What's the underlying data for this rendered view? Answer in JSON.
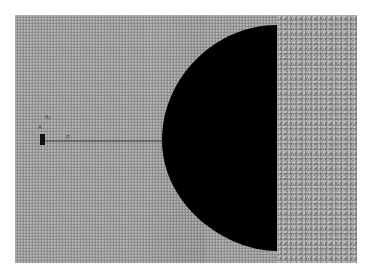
{
  "figure": {
    "background_color": "#ffffff",
    "domain_color": "#9a9a9a",
    "inclusion_color": "#000000",
    "crack_color": "#3a3a3a",
    "labels": {
      "label_a": "θ₀",
      "label_b": "A",
      "label_c": "P"
    }
  }
}
